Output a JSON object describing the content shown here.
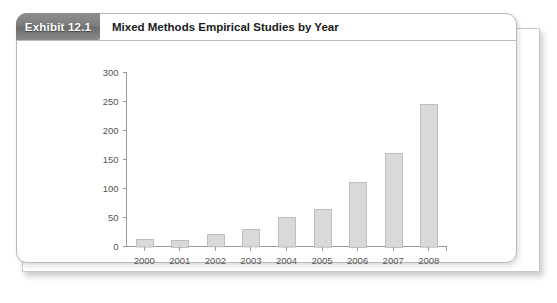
{
  "header": {
    "exhibit_label": "Exhibit 12.1",
    "title": "Mixed Methods Empirical Studies by Year"
  },
  "colors": {
    "tab_background": "#7d7d7d",
    "tab_text": "#ffffff",
    "bar_fill": "#d9d9d9",
    "bar_stroke": "#bdbdbd",
    "axis": "#9a9a9a",
    "axis_text": "#555555",
    "panel_background": "#ffffff",
    "panel_border": "#b8b8b8"
  },
  "chart_data": {
    "type": "bar",
    "title": "Mixed Methods Empirical Studies by Year",
    "xlabel": "",
    "ylabel": "",
    "categories": [
      "2000",
      "2001",
      "2002",
      "2003",
      "2004",
      "2005",
      "2006",
      "2007",
      "2008"
    ],
    "values": [
      13,
      12,
      21,
      30,
      51,
      65,
      112,
      162,
      246
    ],
    "ylim": [
      0,
      300
    ],
    "yticks": [
      0,
      50,
      100,
      150,
      200,
      250,
      300
    ],
    "ytick_labels": [
      "0",
      "50",
      "100",
      "150",
      "200",
      "250",
      "300"
    ],
    "grid": false,
    "legend": "none"
  }
}
